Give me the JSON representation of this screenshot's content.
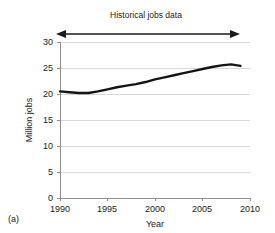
{
  "figure": {
    "panel_label": "(a)",
    "background_color": "#ffffff"
  },
  "chart_data": {
    "type": "line",
    "title": "Historical jobs data",
    "xlabel": "Year",
    "ylabel": "Million jobs",
    "xlim": [
      1990,
      2010
    ],
    "ylim": [
      0,
      30
    ],
    "xticks": [
      1990,
      1995,
      2000,
      2005,
      2010
    ],
    "xtick_labels": [
      "1990",
      "1995",
      "2000",
      "2005",
      "2010"
    ],
    "yticks": [
      0,
      5,
      10,
      15,
      20,
      25,
      30
    ],
    "ytick_labels": [
      "0",
      "5",
      "10",
      "15",
      "20",
      "25",
      "30"
    ],
    "grid": "horizontal",
    "legend": null,
    "line_color": "#141414",
    "x": [
      1990,
      1991,
      1992,
      1993,
      1994,
      1995,
      1996,
      1997,
      1998,
      1999,
      2000,
      2001,
      2002,
      2003,
      2004,
      2005,
      2006,
      2007,
      2008,
      2009
    ],
    "values": [
      20.5,
      20.35,
      20.2,
      20.2,
      20.5,
      20.9,
      21.3,
      21.6,
      21.9,
      22.3,
      22.8,
      23.2,
      23.6,
      24.0,
      24.4,
      24.8,
      25.2,
      25.5,
      25.7,
      25.4
    ],
    "series": [
      {
        "name": "Million jobs",
        "values": [
          20.5,
          20.35,
          20.2,
          20.2,
          20.5,
          20.9,
          21.3,
          21.6,
          21.9,
          22.3,
          22.8,
          23.2,
          23.6,
          24.0,
          24.4,
          24.8,
          25.2,
          25.5,
          25.7,
          25.4
        ]
      }
    ],
    "annotations": [
      {
        "type": "double-headed-arrow",
        "label": "Historical jobs data",
        "x_start": 1990,
        "x_end": 2009,
        "y": 31.2
      }
    ]
  }
}
